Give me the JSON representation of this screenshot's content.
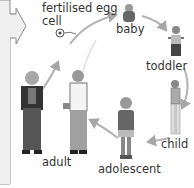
{
  "diagram": {
    "stages": [
      {
        "id": "egg",
        "label_line1": "fertilised egg",
        "label_line2": "cell"
      },
      {
        "id": "baby",
        "label": "baby"
      },
      {
        "id": "toddler",
        "label": "toddler"
      },
      {
        "id": "child",
        "label": "child"
      },
      {
        "id": "adolescent",
        "label": "adolescent"
      },
      {
        "id": "adult",
        "label": "adult"
      }
    ],
    "colors": {
      "arrow": "#a6a6a6",
      "panel_fill": "#f0f0f0",
      "panel_stroke": "#8c8c8c",
      "text": "#333333"
    }
  }
}
